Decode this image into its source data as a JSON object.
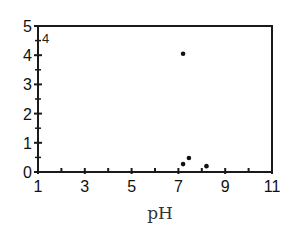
{
  "chart_data": {
    "type": "scatter",
    "title": "",
    "panel_label": "4",
    "xlabel": "pH",
    "ylabel": "",
    "xlim": [
      1,
      11
    ],
    "ylim": [
      0,
      5
    ],
    "x_tick_labels": [
      "1",
      "3",
      "5",
      "7",
      "9",
      "11"
    ],
    "x_tick_values": [
      1,
      3,
      5,
      7,
      9,
      11
    ],
    "x_minor_ticks": [
      2,
      4,
      6,
      8,
      10
    ],
    "y_tick_labels": [
      "0",
      "1",
      "2",
      "3",
      "4",
      "5"
    ],
    "y_tick_values": [
      0,
      1,
      2,
      3,
      4,
      5
    ],
    "y_minor_ticks": [
      0.5,
      1.5,
      2.5,
      3.5,
      4.5
    ],
    "grid": false,
    "legend": null,
    "series": [
      {
        "name": "data",
        "color": "#111111",
        "x": [
          7.2,
          7.2,
          7.45,
          8.2
        ],
        "y": [
          4.05,
          0.27,
          0.48,
          0.2
        ]
      }
    ]
  }
}
